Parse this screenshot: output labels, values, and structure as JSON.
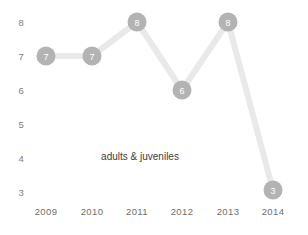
{
  "chart_data": {
    "type": "line",
    "title": "",
    "subtitle": "",
    "xlabel": "",
    "ylabel": "",
    "categories": [
      "2009",
      "2010",
      "2011",
      "2012",
      "2013",
      "2014"
    ],
    "values": [
      7,
      7,
      8,
      6,
      8,
      3
    ],
    "point_labels": [
      "7",
      "7",
      "8",
      "6",
      "8",
      "3"
    ],
    "series": [
      {
        "name": "adults & juveniles",
        "values": [
          7,
          7,
          8,
          6,
          8,
          3
        ]
      }
    ],
    "ylim": [
      3,
      8
    ],
    "xlim": [
      "2009",
      "2014"
    ],
    "y_ticks": [
      "8",
      "7",
      "6",
      "5",
      "4",
      "3"
    ],
    "y_tick_values": [
      8,
      7,
      6,
      5,
      4,
      3
    ],
    "x_ticks": [
      "2009",
      "2010",
      "2011",
      "2012",
      "2013",
      "2014"
    ],
    "grid": false,
    "legend": "none",
    "annotations": [
      {
        "text": "adults & juveniles",
        "x": 140,
        "y": 157
      }
    ],
    "colors": {
      "line": "#e9e9e9",
      "marker_fill": "#b3b3b3",
      "marker_text": "#ffffff",
      "tick_text": "#7d7d7d",
      "annotation_text": "#3c3c3c",
      "background": "#ffffff"
    }
  },
  "geometry": {
    "width": 308,
    "height": 235,
    "point_px": [
      {
        "x": 46,
        "y": 56
      },
      {
        "x": 92,
        "y": 56
      },
      {
        "x": 137,
        "y": 22
      },
      {
        "x": 182,
        "y": 90
      },
      {
        "x": 228,
        "y": 22
      },
      {
        "x": 273,
        "y": 190
      }
    ],
    "y_label_px": [
      {
        "y": 51
      },
      {
        "y": 85
      },
      {
        "y": 119
      },
      {
        "y": 153
      },
      {
        "y": 187
      },
      {
        "y": 221
      }
    ],
    "x_label_px": [
      {
        "x": 46
      },
      {
        "x": 92
      },
      {
        "x": 137
      },
      {
        "x": 182
      },
      {
        "x": 228
      },
      {
        "x": 273
      }
    ]
  }
}
